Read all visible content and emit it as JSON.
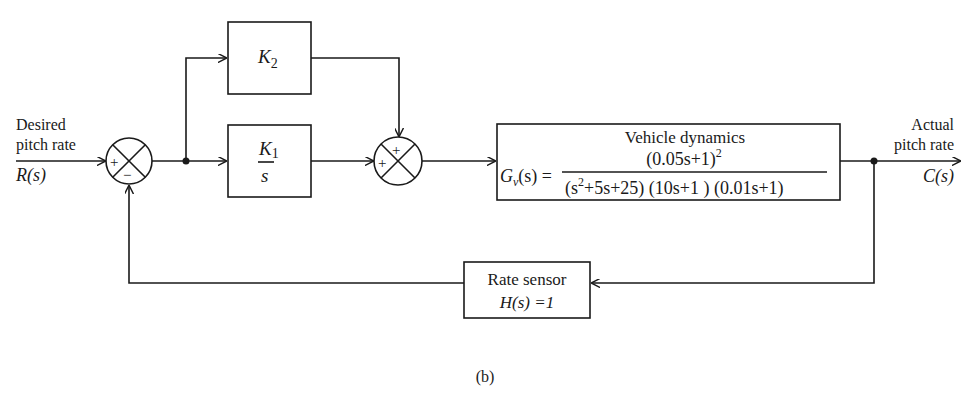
{
  "diagram": {
    "type": "block-diagram",
    "caption": "(b)",
    "input": {
      "label_line1": "Desired",
      "label_line2": "pitch rate",
      "signal": "R(s)"
    },
    "output": {
      "label_line1": "Actual",
      "label_line2": "pitch rate",
      "signal": "C(s)"
    },
    "summing_junctions": [
      {
        "id": "sum1",
        "signs": {
          "left": "+",
          "bottom": "−"
        }
      },
      {
        "id": "sum2",
        "signs": {
          "top": "+",
          "left": "+"
        }
      }
    ],
    "blocks": {
      "k2": {
        "symbol": "K",
        "subscript": "2"
      },
      "k1": {
        "numerator": "K",
        "numerator_subscript": "1",
        "denominator": "s"
      },
      "vehicle": {
        "title": "Vehicle dynamics",
        "lhs_symbol": "G",
        "lhs_subscript": "v",
        "lhs_arg": "(s) =",
        "numerator": "(0.05s+1)",
        "numerator_exponent": "2",
        "denominator_part1": "(s",
        "denominator_exp": "2",
        "denominator_part2": "+5s+25) (10s+1 ) (0.01s+1)"
      },
      "sensor": {
        "title": "Rate sensor",
        "equation": "H(s) =1"
      }
    }
  }
}
